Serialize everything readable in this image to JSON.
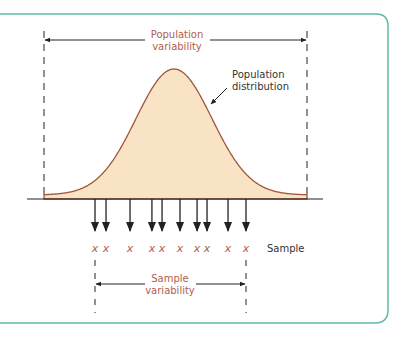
{
  "colors": {
    "frame": "#5fb8a8",
    "curve_stroke": "#a0553a",
    "curve_fill": "#f8e3c4",
    "accent_text": "#b0604a",
    "ink": "#222222"
  },
  "labels": {
    "population_variability_line1": "Population",
    "population_variability_line2": "variability",
    "population_distribution_line1": "Population",
    "population_distribution_line2": "distribution",
    "sample": "Sample",
    "sample_variability_line1": "Sample",
    "sample_variability_line2": "variability"
  },
  "sample": {
    "count": 10,
    "mark_glyph": "X",
    "positions_relative": [
      0.0,
      0.073,
      0.232,
      0.377,
      0.444,
      0.563,
      0.676,
      0.742,
      0.881,
      1.0
    ]
  }
}
